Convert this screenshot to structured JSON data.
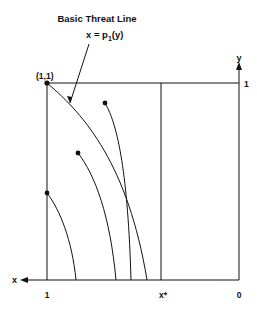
{
  "diagram": {
    "title": "Basic Threat Line",
    "equation": {
      "lhs": "x = p",
      "subscript": "1",
      "rhs": "(y)"
    },
    "corner_label": "(1,1)",
    "axes": {
      "x_label": "x",
      "y_label": "y",
      "y_tick_top": "1",
      "x_tick_left": "1",
      "x_tick_star": "x*",
      "x_tick_right": "0"
    },
    "colors": {
      "line": "#111111",
      "background": "#ffffff"
    }
  }
}
